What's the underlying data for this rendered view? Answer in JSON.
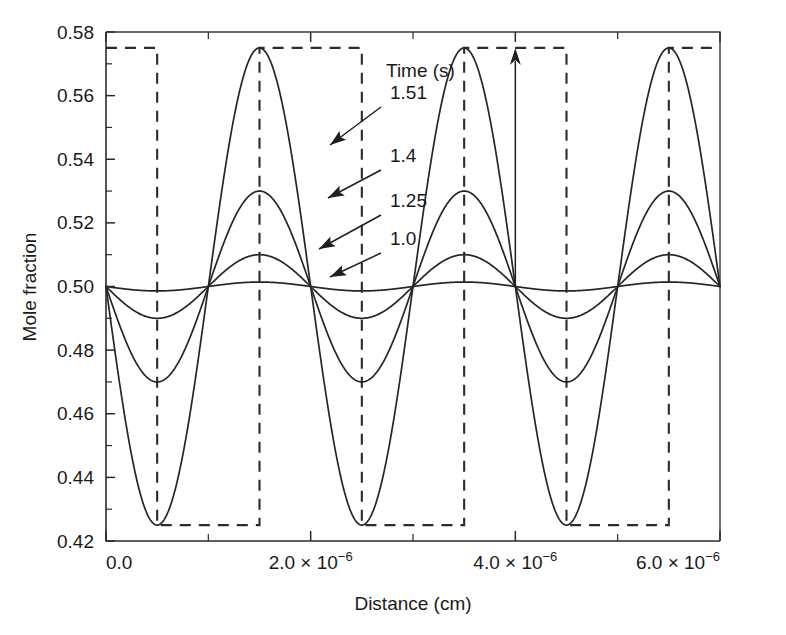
{
  "chart_data": {
    "type": "line",
    "title": "",
    "xlabel": "Distance (cm)",
    "ylabel": "Mole fraction",
    "xlim": [
      0,
      6e-06
    ],
    "ylim": [
      0.42,
      0.58
    ],
    "grid": false,
    "legend_position": "inside-upper-right",
    "legend_title": "Time (s)",
    "x_tick_labels": [
      "0.0",
      "2.0 × 10⁻⁶",
      "4.0 × 10⁻⁶",
      "6.0 × 10⁻⁶"
    ],
    "x_tick_mantissas": [
      "0.0",
      "2.0 × 10",
      "4.0 × 10",
      "6.0 × 10"
    ],
    "x_tick_exponents": [
      "",
      "−6",
      "−6",
      "−6"
    ],
    "x_tick_values": [
      0,
      2e-06,
      4e-06,
      6e-06
    ],
    "x_minor_tick_values": [
      1e-06,
      3e-06,
      5e-06
    ],
    "y_tick_labels": [
      "0.42",
      "0.44",
      "0.46",
      "0.48",
      "0.50",
      "0.52",
      "0.54",
      "0.56",
      "0.58"
    ],
    "y_tick_values": [
      0.42,
      0.44,
      0.46,
      0.48,
      0.5,
      0.52,
      0.54,
      0.56,
      0.58
    ],
    "y_minor_tick_values": [
      0.43,
      0.45,
      0.47,
      0.49,
      0.51,
      0.53,
      0.55,
      0.57
    ],
    "baseline": 0.5,
    "wavelength": 2e-06,
    "phase_offset": 5e-07,
    "node_positions": [
      5e-07,
      1.5e-06,
      2.5e-06,
      3.5e-06,
      4.5e-06,
      5.5e-06
    ],
    "series": [
      {
        "name": "1.51",
        "amplitude": 0.075,
        "peak": 0.575,
        "trough": 0.425,
        "label": "1.51"
      },
      {
        "name": "1.4",
        "amplitude": 0.03,
        "peak": 0.53,
        "trough": 0.47,
        "label": "1.4"
      },
      {
        "name": "1.25",
        "amplitude": 0.01,
        "peak": 0.51,
        "trough": 0.49,
        "label": "1.25"
      },
      {
        "name": "1.0",
        "amplitude": 0.0014,
        "peak": 0.5014,
        "trough": 0.4986,
        "label": "1.0"
      }
    ],
    "square_wave": {
      "name": "initial-profile",
      "style": "dashed",
      "high": 0.575,
      "low": 0.425,
      "period": 2e-06,
      "transitions": [
        5e-07,
        1.5e-06,
        2.5e-06,
        3.5e-06,
        4.5e-06,
        5.5e-06
      ],
      "starts_high": true
    },
    "annotations": [
      {
        "name": "arrow-1-51",
        "label": "1.51",
        "label_x": 390,
        "label_y": 99,
        "tip_x": 330,
        "tip_y": 145,
        "tail_x": 381,
        "tail_y": 107
      },
      {
        "name": "arrow-1-4",
        "label": "1.4",
        "label_x": 390,
        "label_y": 162,
        "tip_x": 328,
        "tip_y": 198,
        "tail_x": 381,
        "tail_y": 170
      },
      {
        "name": "arrow-1-25",
        "label": "1.25",
        "label_x": 390,
        "label_y": 207,
        "tip_x": 319,
        "tip_y": 249,
        "tail_x": 381,
        "tail_y": 215
      },
      {
        "name": "arrow-1-0",
        "label": "1.0",
        "label_x": 390,
        "label_y": 245,
        "tip_x": 330,
        "tip_y": 277,
        "tail_x": 381,
        "tail_y": 253
      },
      {
        "name": "growth-arrow",
        "label": "",
        "x_data": 4e-06,
        "y_from": 0.5,
        "y_to": 0.575
      }
    ],
    "colors": {
      "line": "#262626",
      "axis": "#2b2b2b",
      "text": "#1a1a1a",
      "background": "#ffffff"
    }
  }
}
